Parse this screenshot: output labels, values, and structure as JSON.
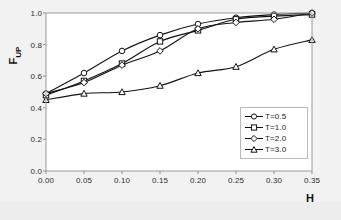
{
  "chart_data": {
    "type": "line",
    "title": "",
    "xlabel": "H",
    "ylabel": "F_UP",
    "ylabel_base": "F",
    "ylabel_sub": "UP",
    "x": [
      0.0,
      0.05,
      0.1,
      0.15,
      0.2,
      0.25,
      0.3,
      0.35
    ],
    "xlim": [
      0.0,
      0.35
    ],
    "ylim": [
      0.0,
      1.0
    ],
    "xticks": [
      "0.00",
      "0.05",
      "0.10",
      "0.15",
      "0.20",
      "0.25",
      "0.30",
      "0.35"
    ],
    "xtick_values": [
      0.0,
      0.05,
      0.1,
      0.15,
      0.2,
      0.25,
      0.3,
      0.35
    ],
    "yticks": [
      "0.0",
      "0.2",
      "0.4",
      "0.6",
      "0.8",
      "1.0"
    ],
    "ytick_values": [
      0.0,
      0.2,
      0.4,
      0.6,
      0.8,
      1.0
    ],
    "grid": false,
    "legend_position": "lower right",
    "line_color": "#111111",
    "marker_fill": "#ffffff",
    "series": [
      {
        "name": "T=0.5",
        "marker": "circle",
        "values": [
          0.49,
          0.62,
          0.76,
          0.86,
          0.93,
          0.97,
          0.99,
          1.0
        ]
      },
      {
        "name": "T=1.0",
        "marker": "square",
        "values": [
          0.48,
          0.57,
          0.68,
          0.82,
          0.89,
          0.96,
          0.98,
          0.99
        ]
      },
      {
        "name": "T=2.0",
        "marker": "diamond",
        "values": [
          0.49,
          0.56,
          0.67,
          0.76,
          0.9,
          0.94,
          0.96,
          1.0
        ]
      },
      {
        "name": "T=3.0",
        "marker": "triangle",
        "values": [
          0.45,
          0.49,
          0.5,
          0.54,
          0.62,
          0.66,
          0.77,
          0.83
        ]
      }
    ]
  },
  "legend": {
    "items": [
      {
        "label": "T=0.5"
      },
      {
        "label": "T=1.0"
      },
      {
        "label": "T=2.0"
      },
      {
        "label": "T=3.0"
      }
    ]
  },
  "axes": {
    "x_title": "H",
    "y_title_base": "F",
    "y_title_sub": "UP"
  }
}
